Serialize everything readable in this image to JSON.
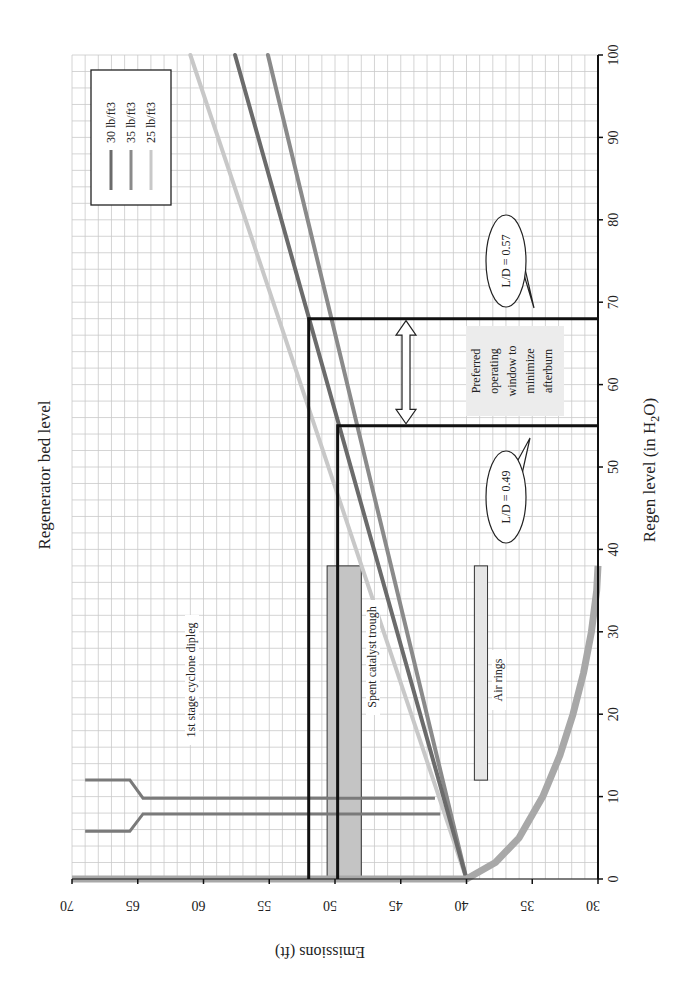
{
  "chart_data": {
    "type": "line",
    "orientation": "rotated 90 degrees clockwise (page landscape chart printed in portrait)",
    "title": "Regenerator bed level",
    "xlabel": "Regen level (in H2O)",
    "xlabel_parts": {
      "main": "Regen level (in H",
      "sub": "2",
      "end": "O)"
    },
    "ylabel": "Emissions (ft)",
    "xlim": [
      0,
      100
    ],
    "ylim": [
      30,
      70
    ],
    "x_ticks": [
      0,
      10,
      20,
      30,
      40,
      50,
      60,
      70,
      80,
      90,
      100
    ],
    "y_ticks": [
      30,
      35,
      40,
      45,
      50,
      55,
      60,
      65,
      70
    ],
    "grid": true,
    "legend_position": "upper right (in rotated view: top-left)",
    "series": [
      {
        "name": "30 lb/ft3",
        "color": "#6b6b6b",
        "x": [
          0,
          100
        ],
        "y": [
          40,
          57.6
        ]
      },
      {
        "name": "35 lb/ft3",
        "color": "#8a8a8a",
        "x": [
          0,
          100
        ],
        "y": [
          40,
          55.1
        ]
      },
      {
        "name": "25 lb/ft3",
        "color": "#c8c8c8",
        "x": [
          0,
          100
        ],
        "y": [
          40,
          61.0
        ]
      }
    ],
    "bed_profile": {
      "color": "#a8a8a8",
      "points": [
        [
          0,
          70
        ],
        [
          0,
          40
        ],
        [
          2,
          37.8
        ],
        [
          5,
          36.0
        ],
        [
          10,
          34.2
        ],
        [
          15,
          32.9
        ],
        [
          20,
          31.9
        ],
        [
          25,
          31.1
        ],
        [
          30,
          30.5
        ],
        [
          35,
          30.1
        ],
        [
          38,
          30.0
        ]
      ]
    },
    "reference_lines": [
      {
        "label": "L/D = 0.49",
        "regen_level": 55,
        "emissions": 49.8
      },
      {
        "label": "L/D = 0.57",
        "regen_level": 68,
        "emissions": 52.0
      }
    ],
    "regions": [
      {
        "label": "Spent catalyst trough",
        "regen_range": [
          0,
          38
        ],
        "emissions_range": [
          48.0,
          50.6
        ],
        "color": "#c4c4c4"
      },
      {
        "label": "Air rings",
        "regen_range": [
          12,
          38
        ],
        "emissions_range": [
          38.4,
          39.4
        ],
        "color": "#e6e6e6"
      }
    ],
    "diplegs": {
      "label": "1st stage cyclone dipleg",
      "legs": [
        {
          "regen_top": [
            5.8,
            7.9
          ],
          "emissions_from": 69.0,
          "emissions_to": 42.0
        },
        {
          "regen_top": [
            12.0,
            9.8
          ],
          "emissions_from": 69.0,
          "emissions_to": 42.4
        }
      ]
    },
    "annotations": [
      {
        "text": "Preferred operating window to minimize afterburn",
        "regen_range": [
          55,
          68
        ]
      },
      {
        "text": "L/D = 0.49"
      },
      {
        "text": "L/D = 0.57"
      }
    ]
  },
  "labels": {
    "title": "Regenerator bed level",
    "xaxis_main": "Regen level (in H",
    "xaxis_sub": "2",
    "xaxis_end": "O)",
    "yaxis": "Emissions (ft)",
    "legend": [
      "30 lb/ft3",
      "35 lb/ft3",
      "25 lb/ft3"
    ],
    "dipleg": "1st stage cyclone dipleg",
    "trough": "Spent catalyst trough",
    "airrings": "Air rings",
    "ld049": "L/D = 0.49",
    "ld057": "L/D = 0.57",
    "window": [
      "Preferred",
      "operating",
      "window to",
      "minimize",
      "afterburn"
    ]
  }
}
